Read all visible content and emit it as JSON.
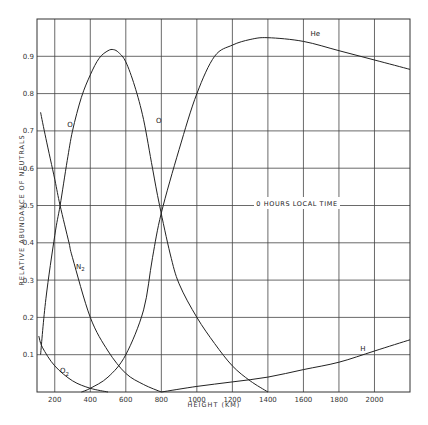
{
  "chart_data": {
    "type": "line",
    "title": "",
    "annotation": "0 HOURS LOCAL TIME",
    "xlabel": "HEIGHT (KM)",
    "ylabel": "RELATIVE ABUNDANCE OF NEUTRALS",
    "xlim": [
      100,
      2200
    ],
    "ylim": [
      0,
      1.0
    ],
    "grid": true,
    "x_ticks": [
      200,
      400,
      600,
      800,
      1000,
      1200,
      1400,
      1600,
      1800,
      2000
    ],
    "x_tick_labels": [
      "200",
      "400",
      "600",
      "800",
      "1000",
      "1200",
      "1400",
      "1600",
      "1800",
      "2000"
    ],
    "y_ticks": [
      0.1,
      0.2,
      0.3,
      0.4,
      0.5,
      0.6,
      0.7,
      0.8,
      0.9
    ],
    "y_tick_labels": [
      "0.1",
      "0.2",
      "0.3",
      "0.4",
      "0.5",
      "0.6",
      "0.7",
      "0.8",
      "0.9"
    ],
    "series": [
      {
        "name": "O",
        "label_positions": [
          [
            270,
            0.71
          ],
          [
            770,
            0.72
          ]
        ],
        "x": [
          120,
          150,
          200,
          230,
          270,
          300,
          350,
          400,
          450,
          500,
          530,
          560,
          600,
          650,
          700,
          750,
          790,
          850,
          900,
          1000,
          1100,
          1200,
          1300,
          1400
        ],
        "values": [
          0.1,
          0.25,
          0.42,
          0.5,
          0.62,
          0.7,
          0.79,
          0.85,
          0.895,
          0.915,
          0.918,
          0.91,
          0.885,
          0.82,
          0.73,
          0.6,
          0.5,
          0.37,
          0.29,
          0.2,
          0.13,
          0.07,
          0.03,
          0.0
        ]
      },
      {
        "name": "N2",
        "label_positions": [
          [
            320,
            0.33
          ]
        ],
        "x": [
          120,
          150,
          200,
          230,
          280,
          300,
          400,
          500,
          600,
          700,
          800
        ],
        "values": [
          0.75,
          0.68,
          0.57,
          0.5,
          0.4,
          0.36,
          0.2,
          0.11,
          0.05,
          0.02,
          0.0
        ]
      },
      {
        "name": "O2",
        "label_positions": [
          [
            230,
            0.05
          ]
        ],
        "x": [
          110,
          130,
          200,
          300,
          400,
          500
        ],
        "values": [
          0.15,
          0.12,
          0.07,
          0.03,
          0.01,
          0.0
        ]
      },
      {
        "name": "He",
        "label_positions": [
          [
            1640,
            0.955
          ]
        ],
        "x": [
          350,
          400,
          500,
          600,
          700,
          750,
          800,
          900,
          1000,
          1100,
          1200,
          1300,
          1400,
          1600,
          1800,
          2000,
          2200
        ],
        "values": [
          0.0,
          0.01,
          0.04,
          0.1,
          0.22,
          0.36,
          0.48,
          0.65,
          0.8,
          0.9,
          0.93,
          0.945,
          0.95,
          0.94,
          0.915,
          0.89,
          0.865
        ]
      },
      {
        "name": "H",
        "label_positions": [
          [
            1920,
            0.11
          ]
        ],
        "x": [
          800,
          1000,
          1200,
          1400,
          1600,
          1800,
          2000,
          2200
        ],
        "values": [
          0.0,
          0.015,
          0.027,
          0.04,
          0.06,
          0.08,
          0.11,
          0.14
        ]
      }
    ]
  }
}
